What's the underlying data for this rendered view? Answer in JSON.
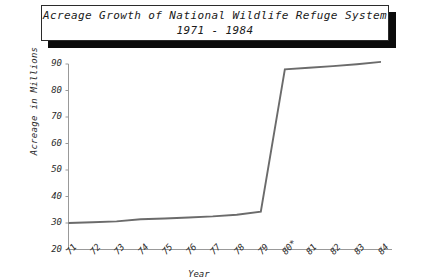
{
  "title": {
    "line1": "Acreage Growth of National Wildlife Refuge System",
    "line2": "1971 - 1984"
  },
  "axes": {
    "y_title": "Acreage in Millions",
    "x_title": "Year"
  },
  "chart_data": {
    "type": "line",
    "title": "Acreage Growth of National Wildlife Refuge System 1971 - 1984",
    "xlabel": "Year",
    "ylabel": "Acreage in Millions",
    "categories": [
      "71",
      "72",
      "73",
      "74",
      "75",
      "76",
      "77",
      "78",
      "79",
      "80*",
      "81",
      "82",
      "83",
      "84"
    ],
    "values": [
      30,
      30.3,
      30.6,
      31.4,
      31.7,
      32.1,
      32.5,
      33.1,
      34.3,
      88,
      88.6,
      89.2,
      89.9,
      90.8
    ],
    "ylim": [
      20,
      90
    ],
    "yticks": [
      20,
      30,
      40,
      50,
      60,
      70,
      80,
      90
    ],
    "ytick_labels": [
      "20",
      "30",
      "40",
      "50",
      "60",
      "70",
      "80",
      "90"
    ],
    "grid": false,
    "legend": false,
    "series_color": "#6b6b6b",
    "axis_color": "#999999",
    "note": "80* marks a discontinuity year label with asterisk"
  },
  "colors": {
    "background": "#ffffff",
    "line": "#6b6b6b",
    "axis": "#9a9a9a",
    "text": "#2a2a2a",
    "title_border": "#2b2b2b",
    "title_shadow": "#0b0b0b"
  }
}
